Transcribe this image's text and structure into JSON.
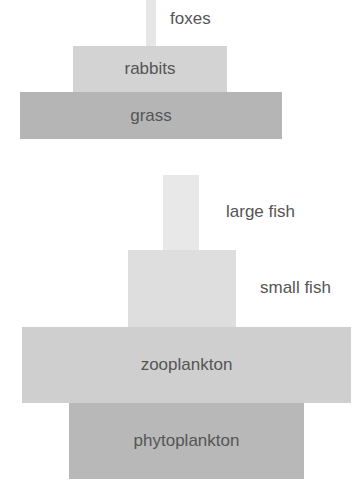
{
  "pyramids": [
    {
      "name": "terrestrial",
      "levels": [
        {
          "label": "foxes",
          "color": "#e6e6e6",
          "label_position": "outside"
        },
        {
          "label": "rabbits",
          "color": "#d3d3d3",
          "label_position": "inside"
        },
        {
          "label": "grass",
          "color": "#b5b5b5",
          "label_position": "inside"
        }
      ]
    },
    {
      "name": "aquatic",
      "levels": [
        {
          "label": "large fish",
          "color": "#e8e8e8",
          "label_position": "outside"
        },
        {
          "label": "small fish",
          "color": "#dedede",
          "label_position": "outside"
        },
        {
          "label": "zooplankton",
          "color": "#cfcfcf",
          "label_position": "inside"
        },
        {
          "label": "phytoplankton",
          "color": "#b8b8b8",
          "label_position": "inside"
        }
      ]
    }
  ]
}
